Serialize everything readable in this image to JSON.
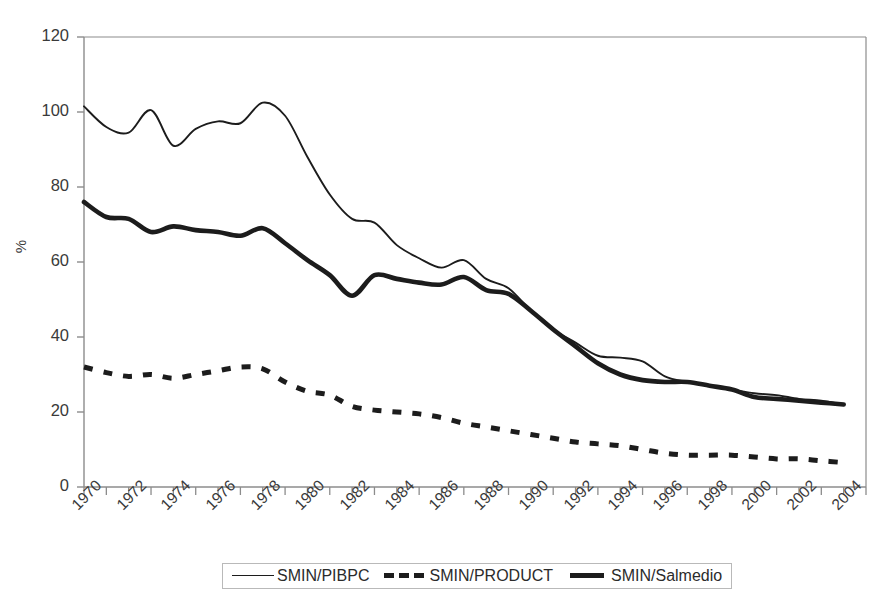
{
  "chart_data": {
    "type": "line",
    "title": "",
    "xlabel": "",
    "ylabel": "%",
    "ylim": [
      0,
      120
    ],
    "ytick_values": [
      0,
      20,
      40,
      60,
      80,
      100,
      120
    ],
    "xlim": [
      1970,
      2005
    ],
    "grid": false,
    "legend_position": "bottom",
    "x": [
      1970,
      1971,
      1972,
      1973,
      1974,
      1975,
      1976,
      1977,
      1978,
      1979,
      1980,
      1981,
      1982,
      1983,
      1984,
      1985,
      1986,
      1987,
      1988,
      1989,
      1990,
      1991,
      1992,
      1993,
      1994,
      1995,
      1996,
      1997,
      1998,
      1999,
      2000,
      2001,
      2002,
      2003,
      2004
    ],
    "xtick_labels": [
      "1970",
      "1972",
      "1974",
      "1976",
      "1978",
      "1980",
      "1982",
      "1984",
      "1986",
      "1988",
      "1990",
      "1992",
      "1994",
      "1996",
      "1998",
      "2000",
      "2002",
      "2004"
    ],
    "series": [
      {
        "name": "SMIN/PIBPC",
        "style": "thin-solid",
        "color": "#1c1c1c",
        "values": [
          101.5,
          96.0,
          94.5,
          100.5,
          91.0,
          95.5,
          97.5,
          97.0,
          102.5,
          99.0,
          88.0,
          78.0,
          71.5,
          70.5,
          64.5,
          61.0,
          58.5,
          60.5,
          55.5,
          53.0,
          47.0,
          42.0,
          38.5,
          35.0,
          34.5,
          33.5,
          29.5,
          28.0,
          27.0,
          26.0,
          25.0,
          24.5,
          23.5,
          23.0,
          22.0
        ]
      },
      {
        "name": "SMIN/PRODUCT",
        "style": "dashed",
        "color": "#1c1c1c",
        "values": [
          32.0,
          30.5,
          29.5,
          30.0,
          29.0,
          30.0,
          31.0,
          32.0,
          31.5,
          28.0,
          25.5,
          24.5,
          21.5,
          20.5,
          20.0,
          19.5,
          18.5,
          17.0,
          16.0,
          15.0,
          14.0,
          13.0,
          12.0,
          11.5,
          11.0,
          10.0,
          9.0,
          8.5,
          8.5,
          8.5,
          8.0,
          7.5,
          7.5,
          7.0,
          6.5
        ]
      },
      {
        "name": "SMIN/Salmedio",
        "style": "thick-solid",
        "color": "#1c1c1c",
        "values": [
          76.0,
          72.0,
          71.5,
          68.0,
          69.5,
          68.5,
          68.0,
          67.0,
          69.0,
          65.0,
          60.5,
          56.5,
          51.0,
          56.5,
          55.5,
          54.5,
          54.0,
          56.0,
          52.5,
          51.5,
          47.0,
          42.0,
          37.5,
          33.0,
          30.0,
          28.5,
          28.0,
          28.0,
          27.0,
          26.0,
          24.0,
          23.5,
          23.0,
          22.5,
          22.0
        ]
      }
    ]
  },
  "legend": {
    "items": [
      {
        "label": "SMIN/PIBPC"
      },
      {
        "label": "SMIN/PRODUCT"
      },
      {
        "label": "SMIN/Salmedio"
      }
    ]
  }
}
